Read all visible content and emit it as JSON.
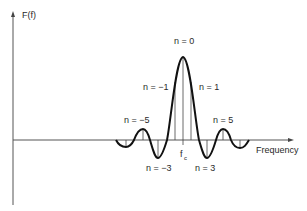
{
  "figure": {
    "y_axis_label": "F(f)",
    "x_axis_label": "Frequency",
    "center_label_main": "f",
    "center_label_sub": "c",
    "harmonic_labels": [
      {
        "id": "n0",
        "text": "n = 0"
      },
      {
        "id": "n1",
        "text": "n = 1"
      },
      {
        "id": "nm1",
        "text": "n = −1"
      },
      {
        "id": "n5",
        "text": "n = 5"
      },
      {
        "id": "nm5",
        "text": "n = −5"
      },
      {
        "id": "n3",
        "text": "n = 3"
      },
      {
        "id": "nm3",
        "text": "n = −3"
      }
    ],
    "colors": {
      "curve": "#111111",
      "axis": "#555555",
      "text": "#2a2a2a",
      "background": "#ffffff"
    }
  }
}
